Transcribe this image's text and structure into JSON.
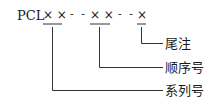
{
  "code": {
    "prefix": "PCL",
    "group1": "× ×",
    "sep1": "- -",
    "group2": "× ×",
    "sep2": "- -",
    "group3": "×"
  },
  "labels": {
    "suffix": "尾注",
    "sequence": "顺序号",
    "series": "系列号"
  },
  "colors": {
    "line": "#333333",
    "text": "#1a1a1a"
  }
}
